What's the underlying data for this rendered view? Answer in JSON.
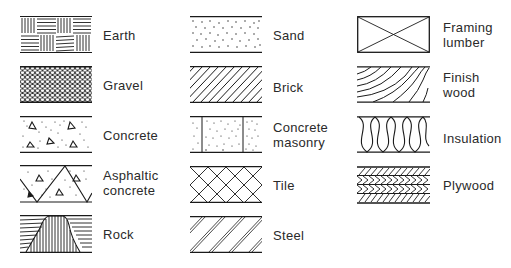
{
  "legend": {
    "columns": [
      {
        "items": [
          {
            "label": "Earth",
            "icon": "earth-hatch-icon"
          },
          {
            "label": "Gravel",
            "icon": "gravel-hatch-icon"
          },
          {
            "label": "Concrete",
            "icon": "concrete-hatch-icon"
          },
          {
            "label": "Asphaltic concrete",
            "line1": "Asphaltic",
            "line2": "concrete",
            "icon": "asphaltic-concrete-hatch-icon"
          },
          {
            "label": "Rock",
            "icon": "rock-hatch-icon"
          }
        ]
      },
      {
        "items": [
          {
            "label": "Sand",
            "icon": "sand-hatch-icon"
          },
          {
            "label": "Brick",
            "icon": "brick-hatch-icon"
          },
          {
            "label": "Concrete masonry",
            "line1": "Concrete",
            "line2": "masonry",
            "icon": "concrete-masonry-hatch-icon"
          },
          {
            "label": "Tile",
            "icon": "tile-hatch-icon"
          },
          {
            "label": "Steel",
            "icon": "steel-hatch-icon"
          }
        ]
      },
      {
        "items": [
          {
            "label": "Framing lumber",
            "line1": "Framing",
            "line2": "lumber",
            "icon": "framing-lumber-hatch-icon"
          },
          {
            "label": "Finish wood",
            "line1": "Finish",
            "line2": "wood",
            "icon": "finish-wood-hatch-icon"
          },
          {
            "label": "Insulation",
            "icon": "insulation-hatch-icon"
          },
          {
            "label": "Plywood",
            "icon": "plywood-hatch-icon"
          }
        ]
      }
    ]
  },
  "colors": {
    "ink": "#1a1a1a",
    "background": "#ffffff"
  }
}
